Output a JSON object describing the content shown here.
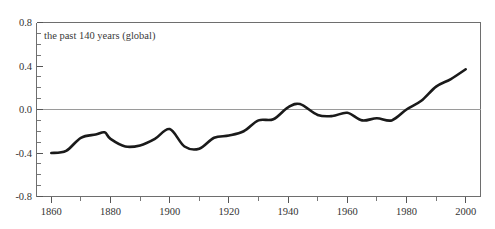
{
  "figure": {
    "cut_off_heading": "Temperature variations (relative to 1961–1990 average)",
    "annotation": "the past 140 years (global)"
  },
  "axes": {
    "y_ticks": [
      "0.8",
      "0.4",
      "0.0",
      "-0.4",
      "-0.8"
    ],
    "x_ticks": [
      "1860",
      "1880",
      "1900",
      "1920",
      "1940",
      "1960",
      "1980",
      "2000"
    ]
  },
  "colors": {
    "line": "#1a1a1a",
    "frame": "#6e6e6e",
    "zero_line": "#9a9a9a",
    "background": "#ffffff",
    "text": "#333333"
  },
  "chart_data": {
    "type": "line",
    "title": "Temperature variations (relative to 1961–1990 average)",
    "subtitle": "the past 140 years (global)",
    "xlabel": "",
    "ylabel": "",
    "xlim": [
      1855,
      2005
    ],
    "ylim": [
      -0.8,
      0.8
    ],
    "grid": false,
    "legend": "none",
    "zero_reference_line": 0.0,
    "x_tick_values": [
      1860,
      1880,
      1900,
      1920,
      1940,
      1960,
      1980,
      2000
    ],
    "x_minor_tick_interval": 10,
    "y_tick_values": [
      -0.8,
      -0.4,
      0.0,
      0.4,
      0.8
    ],
    "y_minor_tick_interval": 0.1,
    "series": [
      {
        "name": "Global temperature anomaly (°C)",
        "x": [
          1860,
          1865,
          1870,
          1875,
          1878,
          1880,
          1885,
          1890,
          1895,
          1900,
          1905,
          1910,
          1915,
          1920,
          1925,
          1930,
          1935,
          1940,
          1944,
          1950,
          1955,
          1960,
          1965,
          1970,
          1975,
          1980,
          1985,
          1990,
          1995,
          2000
        ],
        "y": [
          -0.4,
          -0.38,
          -0.26,
          -0.23,
          -0.21,
          -0.27,
          -0.34,
          -0.33,
          -0.27,
          -0.18,
          -0.34,
          -0.36,
          -0.26,
          -0.24,
          -0.2,
          -0.1,
          -0.09,
          0.02,
          0.05,
          -0.05,
          -0.06,
          -0.03,
          -0.1,
          -0.08,
          -0.1,
          0.0,
          0.08,
          0.21,
          0.28,
          0.37
        ]
      }
    ]
  }
}
